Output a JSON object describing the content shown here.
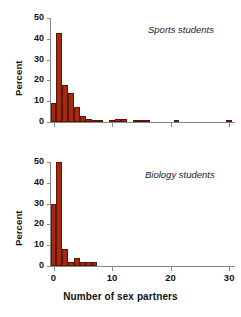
{
  "chart_data": [
    {
      "type": "bar",
      "title": "Sports students",
      "xlabel": "Number of sex partners",
      "ylabel": "Percent",
      "xlim": [
        -0.6,
        31
      ],
      "ylim": [
        0,
        50
      ],
      "xticks": [
        0,
        10,
        20,
        30
      ],
      "yticks": [
        0,
        10,
        20,
        30,
        40,
        50
      ],
      "grid": false,
      "legend": "none",
      "bar_color": "#a42a12",
      "bar_edge_color": "#5e1405",
      "x": [
        0,
        1,
        2,
        3,
        4,
        5,
        6,
        7,
        8,
        9,
        10,
        11,
        12,
        13,
        14,
        15,
        16,
        21,
        30
      ],
      "values": [
        9,
        43,
        18,
        14,
        7,
        3,
        1.5,
        1,
        1,
        0,
        1,
        1.5,
        1.5,
        0,
        1,
        1,
        1,
        1,
        0.8
      ]
    },
    {
      "type": "bar",
      "title": "Biology students",
      "xlabel": "Number of sex partners",
      "ylabel": "Percent",
      "xlim": [
        -0.6,
        31
      ],
      "ylim": [
        0,
        50
      ],
      "xticks": [
        0,
        10,
        20,
        30
      ],
      "yticks": [
        0,
        10,
        20,
        30,
        40,
        50
      ],
      "grid": false,
      "legend": "none",
      "bar_color": "#a42a12",
      "bar_edge_color": "#5e1405",
      "x": [
        0,
        1,
        2,
        3,
        4,
        5,
        6,
        7
      ],
      "values": [
        30,
        50,
        8,
        2,
        4,
        2,
        2,
        2
      ]
    }
  ],
  "axis_title": "Number of sex partners",
  "panels": {
    "sports": {
      "label": "Sports students",
      "ylabel": "Percent",
      "ytick_labels": [
        "0",
        "10",
        "20",
        "30",
        "40",
        "50"
      ]
    },
    "biology": {
      "label": "Biology students",
      "ylabel": "Percent",
      "ytick_labels": [
        "0",
        "10",
        "20",
        "30",
        "40",
        "50"
      ],
      "xtick_labels": [
        "0",
        "10",
        "20",
        "30"
      ]
    }
  }
}
